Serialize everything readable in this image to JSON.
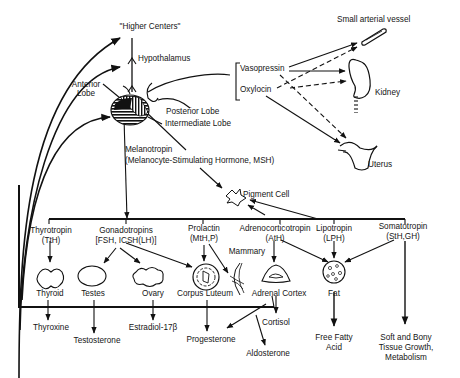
{
  "diagram": {
    "top": {
      "higher_centers": "\"Higher Centers\"",
      "hypothalamus": "Hypothalamus",
      "anterior_lobe": [
        "Anterior",
        "Lobe"
      ],
      "posterior_lobe": "Posterior Lobe",
      "intermediate_lobe": "Intermediate Lobe",
      "melanotropin": "Melanotropin",
      "melanotropin_full": "(Melanocyte-Stimulating Hormone, MSH)",
      "pigment_cell": "Pigment Cell"
    },
    "posterior_hormones": {
      "vasopressin": "Vasopressin",
      "oxytocin": "Oxylocin",
      "targets": {
        "vessel": "Small arterial vessel",
        "kidney": "Kidney",
        "uterus": "Uterus"
      }
    },
    "tropins": [
      {
        "name": "Thyrotropin",
        "abbr": "(TtH)"
      },
      {
        "name": "Gonadotropins",
        "abbr": "[FSH, ICSH(LH)]"
      },
      {
        "name": "Prolactin",
        "abbr": "(MtH,P)"
      },
      {
        "name": "Adrenocorticotropin",
        "abbr": "(AtH)"
      },
      {
        "name": "Lipotropin",
        "abbr": "(LPH)"
      },
      {
        "name": "Somatotropin",
        "abbr": "(StH,GH)"
      }
    ],
    "organs": {
      "thyroid": "Thyroid",
      "testes": "Testes",
      "ovary": "Ovary",
      "corpus_luteum": "Corpus Luteum",
      "mammary": "Mammary",
      "adrenal_cortex": "Adrenal Cortex",
      "fat": "Fat"
    },
    "products": {
      "thyroxine": "Thyroxine",
      "testosterone": "Testosterone",
      "estradiol": "Estradiol-17β",
      "progesterone": "Progesterone",
      "cortisol": "Cortisol",
      "aldosterone": "Aldosterone",
      "free_fatty_acid": [
        "Free Fatty",
        "Acid"
      ],
      "soft_bony": [
        "Soft and Bony",
        "Tissue Growth,",
        "Metabolism"
      ]
    }
  }
}
